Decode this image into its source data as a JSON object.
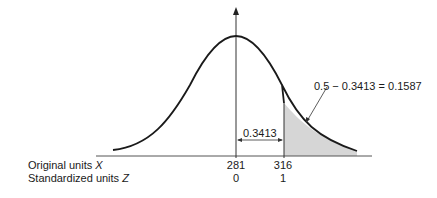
{
  "figure": {
    "type": "normal-distribution-diagram",
    "annotation_area_between": "0.3413",
    "annotation_tail": "0.5 − 0.3413 = 0.1587",
    "rows": [
      {
        "label": "Original units",
        "variable": "X",
        "values": [
          "281",
          "316"
        ]
      },
      {
        "label": "Standardized units",
        "variable": "Z",
        "values": [
          "0",
          "1"
        ]
      }
    ],
    "colors": {
      "curve": "#1a1a1a",
      "shade": "#d6d6d6",
      "axis": "#555555"
    }
  }
}
